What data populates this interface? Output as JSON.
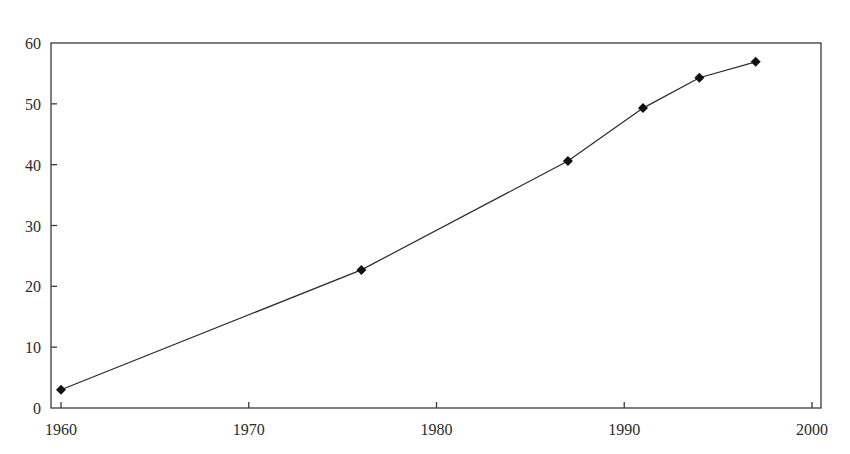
{
  "chart_data": {
    "type": "line",
    "title": "",
    "xlabel": "",
    "ylabel": "",
    "x": [
      1960,
      1976,
      1987,
      1991,
      1994,
      1997
    ],
    "series": [
      {
        "name": "",
        "values": [
          3.0,
          22.7,
          40.6,
          49.3,
          54.3,
          56.9
        ],
        "marker": "diamond",
        "color": "#111111"
      }
    ],
    "xlim": [
      1960,
      2000
    ],
    "ylim": [
      0,
      60
    ],
    "xticks": [
      1960,
      1970,
      1980,
      1990,
      2000
    ],
    "yticks": [
      0,
      10,
      20,
      30,
      40,
      50,
      60
    ],
    "xtick_labels": [
      "1960",
      "1970",
      "1980",
      "1990",
      "2000"
    ],
    "ytick_labels": [
      "0",
      "10",
      "20",
      "30",
      "40",
      "50",
      "60"
    ],
    "grid": false,
    "legend": null,
    "frame": "box"
  }
}
